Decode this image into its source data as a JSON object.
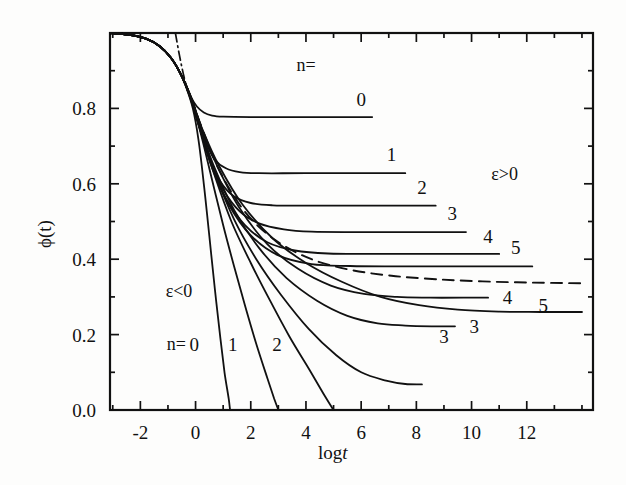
{
  "chart_data": {
    "type": "line",
    "title": "",
    "xlabel": "log t",
    "ylabel": "ϕ(t)",
    "xlim": [
      -3.1,
      14.4
    ],
    "ylim": [
      0.0,
      1.0
    ],
    "xticks": [
      -2,
      0,
      2,
      4,
      6,
      8,
      10,
      12
    ],
    "xtick_labels": [
      "-2",
      "0",
      "2",
      "4",
      "6",
      "8",
      "10",
      "12"
    ],
    "yticks": [
      0.0,
      0.2,
      0.4,
      0.6,
      0.8
    ],
    "ytick_labels": [
      "0.0",
      "0.2",
      "0.4",
      "0.6",
      "0.8"
    ],
    "xminor_step": 1,
    "yminor_step": 0.1,
    "grid": false,
    "legend": "inline-curve-labels",
    "annotations": [
      {
        "name": "n-equals-upper",
        "text": "n=",
        "x": 4.0,
        "y": 0.915
      },
      {
        "name": "epsilon-positive",
        "text": "ε>0",
        "x": 11.2,
        "y": 0.625
      },
      {
        "name": "epsilon-negative",
        "text": "ε<0",
        "x": -0.6,
        "y": 0.315
      },
      {
        "name": "n-equals-lower",
        "text": "n=",
        "x": -0.7,
        "y": 0.175
      }
    ],
    "series": [
      {
        "name": "plateau-0",
        "branch": "epsilon-positive",
        "label": "0",
        "plateau": 0.777,
        "label_x": 6.0,
        "label_y": 0.825,
        "points": [
          [
            -3.1,
            1.0
          ],
          [
            -2.4,
            0.995
          ],
          [
            -1.8,
            0.985
          ],
          [
            -1.3,
            0.965
          ],
          [
            -0.9,
            0.935
          ],
          [
            -0.6,
            0.9
          ],
          [
            -0.35,
            0.862
          ],
          [
            -0.15,
            0.828
          ],
          [
            0.05,
            0.805
          ],
          [
            0.3,
            0.789
          ],
          [
            0.6,
            0.781
          ],
          [
            1.0,
            0.778
          ],
          [
            2.0,
            0.777
          ],
          [
            4.0,
            0.777
          ],
          [
            6.4,
            0.777
          ]
        ]
      },
      {
        "name": "plateau-1",
        "branch": "epsilon-positive",
        "label": "1",
        "plateau": 0.628,
        "label_x": 7.1,
        "label_y": 0.678,
        "points": [
          [
            -3.1,
            1.0
          ],
          [
            -2.4,
            0.995
          ],
          [
            -1.8,
            0.985
          ],
          [
            -1.3,
            0.965
          ],
          [
            -0.9,
            0.935
          ],
          [
            -0.6,
            0.9
          ],
          [
            -0.35,
            0.862
          ],
          [
            -0.1,
            0.818
          ],
          [
            0.15,
            0.76
          ],
          [
            0.4,
            0.706
          ],
          [
            0.7,
            0.664
          ],
          [
            1.1,
            0.641
          ],
          [
            1.6,
            0.631
          ],
          [
            2.3,
            0.628
          ],
          [
            4.0,
            0.628
          ],
          [
            7.6,
            0.628
          ]
        ]
      },
      {
        "name": "plateau-2",
        "branch": "epsilon-positive",
        "label": "2",
        "plateau": 0.542,
        "label_x": 8.2,
        "label_y": 0.592,
        "points": [
          [
            -3.1,
            1.0
          ],
          [
            -2.4,
            0.995
          ],
          [
            -1.8,
            0.985
          ],
          [
            -1.3,
            0.965
          ],
          [
            -0.9,
            0.935
          ],
          [
            -0.6,
            0.9
          ],
          [
            -0.35,
            0.862
          ],
          [
            -0.1,
            0.815
          ],
          [
            0.2,
            0.745
          ],
          [
            0.5,
            0.672
          ],
          [
            0.9,
            0.606
          ],
          [
            1.4,
            0.566
          ],
          [
            2.0,
            0.549
          ],
          [
            2.8,
            0.543
          ],
          [
            4.0,
            0.542
          ],
          [
            6.0,
            0.542
          ],
          [
            8.7,
            0.542
          ]
        ]
      },
      {
        "name": "plateau-3",
        "branch": "epsilon-positive",
        "label": "3",
        "plateau": 0.472,
        "label_x": 9.3,
        "label_y": 0.522,
        "points": [
          [
            -3.1,
            1.0
          ],
          [
            -2.4,
            0.995
          ],
          [
            -1.8,
            0.985
          ],
          [
            -1.3,
            0.965
          ],
          [
            -0.9,
            0.935
          ],
          [
            -0.6,
            0.9
          ],
          [
            -0.35,
            0.862
          ],
          [
            -0.1,
            0.813
          ],
          [
            0.2,
            0.74
          ],
          [
            0.55,
            0.66
          ],
          [
            1.0,
            0.585
          ],
          [
            1.6,
            0.527
          ],
          [
            2.3,
            0.495
          ],
          [
            3.2,
            0.479
          ],
          [
            4.2,
            0.473
          ],
          [
            6.0,
            0.472
          ],
          [
            9.8,
            0.472
          ]
        ]
      },
      {
        "name": "plateau-4",
        "branch": "epsilon-positive",
        "label": "4",
        "plateau": 0.414,
        "label_x": 10.6,
        "label_y": 0.462,
        "points": [
          [
            -3.1,
            1.0
          ],
          [
            -2.4,
            0.995
          ],
          [
            -1.8,
            0.985
          ],
          [
            -1.3,
            0.965
          ],
          [
            -0.9,
            0.935
          ],
          [
            -0.6,
            0.9
          ],
          [
            -0.35,
            0.862
          ],
          [
            -0.1,
            0.812
          ],
          [
            0.2,
            0.738
          ],
          [
            0.6,
            0.648
          ],
          [
            1.1,
            0.562
          ],
          [
            1.8,
            0.49
          ],
          [
            2.6,
            0.445
          ],
          [
            3.6,
            0.423
          ],
          [
            4.8,
            0.415
          ],
          [
            6.5,
            0.414
          ],
          [
            11.0,
            0.414
          ]
        ]
      },
      {
        "name": "plateau-5",
        "branch": "epsilon-positive",
        "label": "5",
        "plateau": 0.381,
        "label_x": 11.6,
        "label_y": 0.432,
        "points": [
          [
            -3.1,
            1.0
          ],
          [
            -2.4,
            0.995
          ],
          [
            -1.8,
            0.985
          ],
          [
            -1.3,
            0.965
          ],
          [
            -0.9,
            0.935
          ],
          [
            -0.6,
            0.9
          ],
          [
            -0.35,
            0.862
          ],
          [
            -0.1,
            0.811
          ],
          [
            0.2,
            0.736
          ],
          [
            0.6,
            0.642
          ],
          [
            1.2,
            0.545
          ],
          [
            2.0,
            0.463
          ],
          [
            3.0,
            0.41
          ],
          [
            4.2,
            0.387
          ],
          [
            5.6,
            0.382
          ],
          [
            7.5,
            0.381
          ],
          [
            12.2,
            0.381
          ]
        ]
      },
      {
        "name": "decay-0",
        "branch": "epsilon-negative",
        "label": "0",
        "label_x": -0.05,
        "label_y": 0.175,
        "ends_at_zero_x": 1.25,
        "points": [
          [
            -3.1,
            1.0
          ],
          [
            -2.4,
            0.995
          ],
          [
            -1.8,
            0.985
          ],
          [
            -1.3,
            0.965
          ],
          [
            -0.9,
            0.935
          ],
          [
            -0.6,
            0.9
          ],
          [
            -0.35,
            0.858
          ],
          [
            -0.1,
            0.8
          ],
          [
            0.1,
            0.72
          ],
          [
            0.3,
            0.6
          ],
          [
            0.5,
            0.46
          ],
          [
            0.7,
            0.32
          ],
          [
            0.9,
            0.19
          ],
          [
            1.05,
            0.1
          ],
          [
            1.2,
            0.03
          ],
          [
            1.25,
            0.0
          ]
        ]
      },
      {
        "name": "decay-1",
        "branch": "epsilon-negative",
        "label": "1",
        "label_x": 1.35,
        "label_y": 0.175,
        "ends_at_zero_x": 3.0,
        "points": [
          [
            -3.1,
            1.0
          ],
          [
            -2.4,
            0.995
          ],
          [
            -1.8,
            0.985
          ],
          [
            -1.3,
            0.965
          ],
          [
            -0.9,
            0.935
          ],
          [
            -0.6,
            0.9
          ],
          [
            -0.35,
            0.86
          ],
          [
            -0.1,
            0.807
          ],
          [
            0.2,
            0.73
          ],
          [
            0.6,
            0.61
          ],
          [
            1.0,
            0.49
          ],
          [
            1.4,
            0.38
          ],
          [
            1.8,
            0.275
          ],
          [
            2.2,
            0.175
          ],
          [
            2.6,
            0.085
          ],
          [
            2.85,
            0.03
          ],
          [
            3.0,
            0.0
          ]
        ]
      },
      {
        "name": "decay-2",
        "branch": "epsilon-negative",
        "label": "2",
        "label_x": 2.95,
        "label_y": 0.175,
        "ends_at_zero_x": 5.0,
        "points": [
          [
            -3.1,
            1.0
          ],
          [
            -2.4,
            0.995
          ],
          [
            -1.8,
            0.985
          ],
          [
            -1.3,
            0.965
          ],
          [
            -0.9,
            0.935
          ],
          [
            -0.6,
            0.9
          ],
          [
            -0.35,
            0.861
          ],
          [
            -0.1,
            0.809
          ],
          [
            0.2,
            0.735
          ],
          [
            0.7,
            0.62
          ],
          [
            1.3,
            0.5
          ],
          [
            2.0,
            0.39
          ],
          [
            2.7,
            0.29
          ],
          [
            3.4,
            0.195
          ],
          [
            4.1,
            0.11
          ],
          [
            4.7,
            0.035
          ],
          [
            5.0,
            0.0
          ]
        ]
      },
      {
        "name": "decay-3",
        "branch": "epsilon-negative",
        "label": "3",
        "label_x": 9.0,
        "label_y": 0.195,
        "end_value": 0.068,
        "points": [
          [
            -3.1,
            1.0
          ],
          [
            -2.4,
            0.995
          ],
          [
            -1.8,
            0.985
          ],
          [
            -1.3,
            0.965
          ],
          [
            -0.9,
            0.935
          ],
          [
            -0.6,
            0.9
          ],
          [
            -0.35,
            0.861
          ],
          [
            -0.1,
            0.81
          ],
          [
            0.2,
            0.737
          ],
          [
            0.7,
            0.628
          ],
          [
            1.4,
            0.505
          ],
          [
            2.2,
            0.4
          ],
          [
            3.1,
            0.305
          ],
          [
            4.1,
            0.215
          ],
          [
            5.1,
            0.145
          ],
          [
            6.0,
            0.1
          ],
          [
            6.9,
            0.078
          ],
          [
            7.6,
            0.069
          ],
          [
            8.2,
            0.068
          ]
        ]
      },
      {
        "name": "lower-3",
        "branch": "epsilon-negative-plateau",
        "label": "3",
        "label_x": 10.1,
        "label_y": 0.222,
        "end_value": 0.222,
        "points": [
          [
            -0.35,
            0.862
          ],
          [
            -0.1,
            0.812
          ],
          [
            0.2,
            0.74
          ],
          [
            0.7,
            0.64
          ],
          [
            1.4,
            0.53
          ],
          [
            2.3,
            0.43
          ],
          [
            3.3,
            0.35
          ],
          [
            4.4,
            0.29
          ],
          [
            5.5,
            0.25
          ],
          [
            6.6,
            0.23
          ],
          [
            7.6,
            0.224
          ],
          [
            8.6,
            0.222
          ],
          [
            9.4,
            0.222
          ]
        ]
      },
      {
        "name": "lower-4",
        "branch": "epsilon-negative-plateau",
        "label": "4",
        "label_x": 11.3,
        "label_y": 0.3,
        "end_value": 0.3,
        "points": [
          [
            -0.35,
            0.862
          ],
          [
            -0.1,
            0.813
          ],
          [
            0.25,
            0.742
          ],
          [
            0.8,
            0.645
          ],
          [
            1.6,
            0.535
          ],
          [
            2.6,
            0.44
          ],
          [
            3.7,
            0.375
          ],
          [
            4.9,
            0.33
          ],
          [
            6.1,
            0.308
          ],
          [
            7.3,
            0.3
          ],
          [
            8.5,
            0.298
          ],
          [
            9.7,
            0.298
          ],
          [
            10.6,
            0.298
          ]
        ]
      },
      {
        "name": "lower-5",
        "branch": "epsilon-negative-plateau",
        "label": "5",
        "label_x": 12.6,
        "label_y": 0.278,
        "end_value": 0.26,
        "points": [
          [
            -0.35,
            0.862
          ],
          [
            -0.1,
            0.814
          ],
          [
            0.25,
            0.744
          ],
          [
            0.85,
            0.648
          ],
          [
            1.7,
            0.545
          ],
          [
            2.8,
            0.455
          ],
          [
            4.0,
            0.39
          ],
          [
            5.3,
            0.34
          ],
          [
            6.7,
            0.3
          ],
          [
            8.1,
            0.278
          ],
          [
            9.5,
            0.266
          ],
          [
            11.0,
            0.261
          ],
          [
            12.5,
            0.26
          ],
          [
            14.0,
            0.26
          ]
        ]
      },
      {
        "name": "critical-dashed",
        "style": "dashed",
        "label": "",
        "points": [
          [
            -0.4,
            0.87
          ],
          [
            -0.1,
            0.815
          ],
          [
            0.3,
            0.735
          ],
          [
            0.9,
            0.63
          ],
          [
            1.8,
            0.525
          ],
          [
            2.9,
            0.45
          ],
          [
            4.2,
            0.4
          ],
          [
            5.6,
            0.372
          ],
          [
            7.1,
            0.356
          ],
          [
            8.7,
            0.347
          ],
          [
            10.4,
            0.341
          ],
          [
            12.2,
            0.338
          ],
          [
            14.0,
            0.336
          ]
        ]
      },
      {
        "name": "critical-dashdot",
        "style": "dash-dot",
        "label": "",
        "points": [
          [
            -0.73,
            1.0
          ],
          [
            -0.62,
            0.955
          ],
          [
            -0.5,
            0.91
          ],
          [
            -0.38,
            0.872
          ],
          [
            -0.28,
            0.845
          ]
        ]
      }
    ]
  },
  "axes": {
    "y_axis_title": "ϕ(t)",
    "x_axis_title_prefix": "log",
    "x_axis_title_italic": "t"
  }
}
